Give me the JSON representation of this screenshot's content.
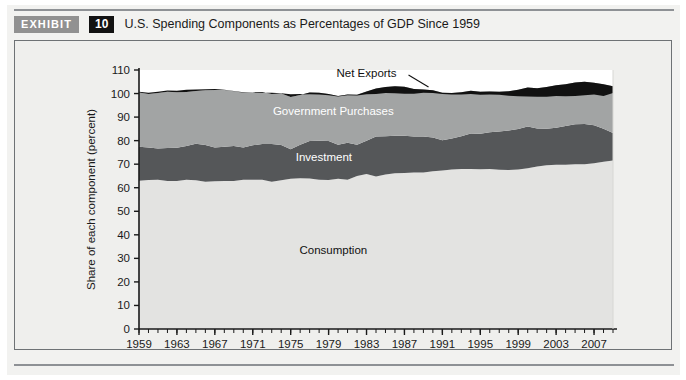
{
  "exhibit": {
    "badge_label": "EXHIBIT",
    "number": "10",
    "title": "U.S. Spending Components as Percentages of GDP Since 1959"
  },
  "colors": {
    "consumption": "#e3e3e1",
    "investment": "#555759",
    "government": "#a2a4a4",
    "net_exports": "#111111",
    "panel_bg": "#efefed",
    "page_bg": "#f2f2f0",
    "plot_bg": "#ffffff",
    "axis": "#1a1a1a",
    "badge_exhibit_bg": "#919191",
    "badge_number_bg": "#121212"
  },
  "chart_data": {
    "type": "area",
    "stacked": true,
    "title": "U.S. Spending Components as Percentages of GDP Since 1959",
    "xlabel": "",
    "ylabel": "Share of each component (percent)",
    "ylim": [
      0,
      110
    ],
    "xlim": [
      1959,
      2009
    ],
    "ytick_step": 10,
    "yticks": [
      0,
      10,
      20,
      30,
      40,
      50,
      60,
      70,
      80,
      90,
      100,
      110
    ],
    "xticks": [
      1959,
      1963,
      1967,
      1971,
      1975,
      1979,
      1983,
      1987,
      1991,
      1995,
      1999,
      2003,
      2007
    ],
    "xtick_minor_step": 1,
    "grid": false,
    "legend_position": "inline-labels",
    "x": [
      1959,
      1960,
      1961,
      1962,
      1963,
      1964,
      1965,
      1966,
      1967,
      1968,
      1969,
      1970,
      1971,
      1972,
      1973,
      1974,
      1975,
      1976,
      1977,
      1978,
      1979,
      1980,
      1981,
      1982,
      1983,
      1984,
      1985,
      1986,
      1987,
      1988,
      1989,
      1990,
      1991,
      1992,
      1993,
      1994,
      1995,
      1996,
      1997,
      1998,
      1999,
      2000,
      2001,
      2002,
      2003,
      2004,
      2005,
      2006,
      2007,
      2008,
      2009
    ],
    "series": [
      {
        "name": "Consumption",
        "label": "Consumption",
        "color": "#e3e3e1",
        "label_color": "#111111",
        "values": [
          63.0,
          63.3,
          63.4,
          62.9,
          62.9,
          63.4,
          63.2,
          62.5,
          62.7,
          62.9,
          62.9,
          63.4,
          63.4,
          63.4,
          62.5,
          63.2,
          63.8,
          64.0,
          63.9,
          63.4,
          63.3,
          63.8,
          63.4,
          65.0,
          65.8,
          64.8,
          65.6,
          66.1,
          66.3,
          66.5,
          66.5,
          67.0,
          67.3,
          67.7,
          68.0,
          68.0,
          67.9,
          68.0,
          67.6,
          67.5,
          67.7,
          68.3,
          69.0,
          69.5,
          69.8,
          69.8,
          70.0,
          70.0,
          70.4,
          71.0,
          71.6
        ]
      },
      {
        "name": "Investment",
        "label": "Investment",
        "color": "#555759",
        "label_color": "#ffffff",
        "values": [
          14.4,
          13.8,
          13.3,
          14.0,
          14.1,
          14.3,
          15.5,
          15.6,
          14.4,
          14.5,
          14.8,
          13.7,
          14.6,
          15.2,
          16.1,
          14.9,
          12.5,
          14.2,
          15.9,
          16.6,
          16.5,
          14.5,
          15.7,
          13.2,
          14.1,
          17.0,
          16.3,
          16.0,
          15.8,
          15.3,
          15.3,
          14.3,
          12.9,
          13.2,
          13.9,
          15.0,
          15.0,
          15.6,
          16.3,
          16.8,
          17.2,
          17.7,
          16.2,
          15.5,
          15.7,
          16.4,
          17.0,
          17.1,
          16.1,
          14.0,
          11.6
        ]
      },
      {
        "name": "Government Purchases",
        "label": "Government Purchases",
        "color": "#a2a4a4",
        "label_color": "#ffffff",
        "values": [
          23.0,
          22.7,
          23.5,
          23.9,
          23.6,
          23.0,
          22.4,
          23.3,
          24.4,
          24.1,
          23.3,
          23.2,
          22.6,
          22.1,
          21.2,
          21.9,
          22.2,
          21.2,
          20.6,
          20.3,
          20.0,
          20.7,
          20.5,
          21.3,
          21.0,
          20.3,
          20.9,
          21.0,
          20.8,
          20.1,
          19.9,
          20.1,
          20.1,
          19.3,
          18.7,
          18.2,
          17.9,
          17.3,
          16.9,
          16.7,
          16.7,
          16.6,
          17.1,
          17.8,
          18.0,
          17.8,
          17.7,
          17.9,
          18.1,
          18.9,
          19.9
        ]
      },
      {
        "name": "Net Exports",
        "label": "Net Exports",
        "color": "#111111",
        "label_color": "#111111",
        "values": [
          0.4,
          0.5,
          0.6,
          0.5,
          0.6,
          0.9,
          0.6,
          0.4,
          0.4,
          0.1,
          0.1,
          0.2,
          -0.1,
          -0.4,
          0.5,
          0.1,
          1.2,
          0.4,
          -0.7,
          -0.7,
          -0.5,
          -0.3,
          -0.3,
          -0.3,
          -1.2,
          -2.3,
          -2.6,
          -3.0,
          -3.0,
          -2.0,
          -1.4,
          -1.2,
          -0.5,
          -0.6,
          -1.0,
          -1.4,
          -1.3,
          -1.3,
          -1.3,
          -1.9,
          -2.7,
          -3.9,
          -3.7,
          -4.2,
          -4.5,
          -5.1,
          -5.7,
          -5.7,
          -5.0,
          -4.9,
          -2.9
        ]
      }
    ],
    "annotations": [
      {
        "text": "Net Exports",
        "x": 1983,
        "y": 107,
        "leader": true
      }
    ]
  }
}
